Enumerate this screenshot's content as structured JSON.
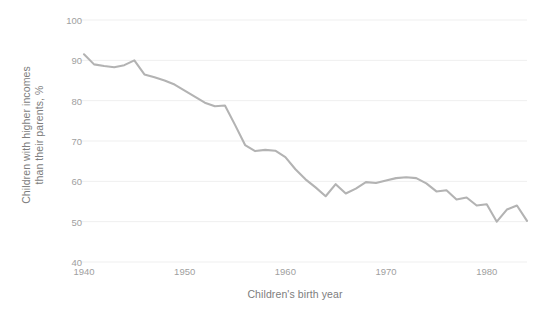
{
  "chart_data": {
    "type": "line",
    "title": "",
    "xlabel": "Children's birth year",
    "ylabel": "Children with higher incomes\nthan their parents, %",
    "ylabel_line1": "Children with higher incomes",
    "ylabel_line2": "than their parents, %",
    "xlim": [
      1940,
      1984
    ],
    "ylim": [
      40,
      100
    ],
    "ytick_labels": [
      "100",
      "90",
      "80",
      "70",
      "60",
      "50",
      "40"
    ],
    "ytick_values": [
      100,
      90,
      80,
      70,
      60,
      50,
      40
    ],
    "xtick_labels": [
      "1940",
      "1950",
      "1960",
      "1970",
      "1980"
    ],
    "xtick_values": [
      1940,
      1950,
      1960,
      1970,
      1980
    ],
    "grid": "horizontal",
    "legend": "none",
    "line_color": "#b3b3b3",
    "grid_color": "#efefef",
    "background_color": "#ffffff",
    "tick_text_color": "#a0a0a0",
    "axis_title_color": "#7d7d7d",
    "series": [
      {
        "name": "Absolute income mobility",
        "x": [
          1940,
          1941,
          1942,
          1943,
          1944,
          1945,
          1946,
          1947,
          1948,
          1949,
          1950,
          1951,
          1952,
          1953,
          1954,
          1955,
          1956,
          1957,
          1958,
          1959,
          1960,
          1961,
          1962,
          1963,
          1964,
          1965,
          1966,
          1967,
          1968,
          1969,
          1970,
          1971,
          1972,
          1973,
          1974,
          1975,
          1976,
          1977,
          1978,
          1979,
          1980,
          1981,
          1982,
          1983,
          1984
        ],
        "values": [
          91.5,
          89.0,
          88.6,
          88.3,
          88.8,
          90.0,
          86.5,
          85.8,
          85.0,
          84.0,
          82.5,
          81.0,
          79.5,
          78.6,
          78.8,
          74.0,
          69.0,
          67.5,
          67.8,
          67.6,
          66.0,
          63.0,
          60.5,
          58.5,
          56.3,
          59.3,
          57.0,
          58.2,
          59.8,
          59.6,
          60.2,
          60.8,
          61.0,
          60.8,
          59.5,
          57.5,
          57.8,
          55.5,
          56.0,
          54.0,
          54.3,
          50.0,
          53.0,
          54.0,
          50.2
        ]
      }
    ]
  }
}
